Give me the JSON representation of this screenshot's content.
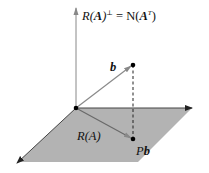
{
  "diagram": {
    "title_label": {
      "prefix": "R(",
      "bold_A": "A",
      "suffix": ")",
      "sup": "⊥",
      "equals": " = N(",
      "bold_A2": "A",
      "sup2": "T",
      "close": ")"
    },
    "vector_b_label": "b",
    "plane_label": {
      "prefix": "R(",
      "bold_A": "A",
      "suffix": ")"
    },
    "projection_label": {
      "prefix": "P",
      "bold_b": "b"
    },
    "colors": {
      "plane_fill": "#b3b3b3",
      "axis": "#555555",
      "vector": "#777777",
      "point": "#000000",
      "dashed": "#222222"
    }
  }
}
